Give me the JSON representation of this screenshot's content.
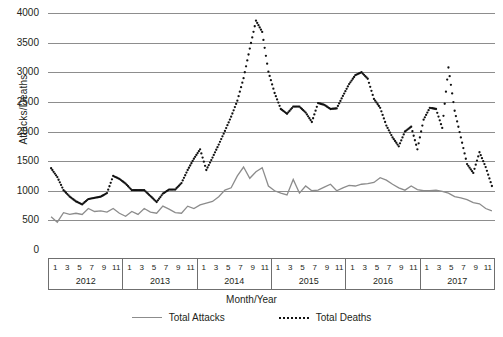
{
  "chart_data": {
    "type": "line",
    "title": "",
    "xlabel": "Month/Year",
    "ylabel": "Attacks/Deaths",
    "ylim": [
      0,
      4000
    ],
    "yticks": [
      0,
      500,
      1000,
      1500,
      2000,
      2500,
      3000,
      3500,
      4000
    ],
    "grid": true,
    "legend_position": "bottom",
    "years": [
      "2012",
      "2013",
      "2014",
      "2015",
      "2016",
      "2017"
    ],
    "month_ticks": [
      "1",
      "3",
      "5",
      "7",
      "9",
      "11"
    ],
    "x": [
      "2012-01",
      "2012-02",
      "2012-03",
      "2012-04",
      "2012-05",
      "2012-06",
      "2012-07",
      "2012-08",
      "2012-09",
      "2012-10",
      "2012-11",
      "2012-12",
      "2013-01",
      "2013-02",
      "2013-03",
      "2013-04",
      "2013-05",
      "2013-06",
      "2013-07",
      "2013-08",
      "2013-09",
      "2013-10",
      "2013-11",
      "2013-12",
      "2014-01",
      "2014-02",
      "2014-03",
      "2014-04",
      "2014-05",
      "2014-06",
      "2014-07",
      "2014-08",
      "2014-09",
      "2014-10",
      "2014-11",
      "2014-12",
      "2015-01",
      "2015-02",
      "2015-03",
      "2015-04",
      "2015-05",
      "2015-06",
      "2015-07",
      "2015-08",
      "2015-09",
      "2015-10",
      "2015-11",
      "2015-12",
      "2016-01",
      "2016-02",
      "2016-03",
      "2016-04",
      "2016-05",
      "2016-06",
      "2016-07",
      "2016-08",
      "2016-09",
      "2016-10",
      "2016-11",
      "2016-12",
      "2017-01",
      "2017-02",
      "2017-03",
      "2017-04",
      "2017-05",
      "2017-06",
      "2017-07",
      "2017-08",
      "2017-09",
      "2017-10",
      "2017-11",
      "2017-12"
    ],
    "series": [
      {
        "name": "Total Attacks",
        "style": "solid",
        "color": "#8c8c8c",
        "values": [
          560,
          470,
          630,
          600,
          620,
          600,
          700,
          650,
          660,
          640,
          700,
          620,
          570,
          650,
          600,
          700,
          640,
          620,
          740,
          690,
          630,
          620,
          740,
          700,
          760,
          790,
          820,
          900,
          1010,
          1050,
          1250,
          1400,
          1210,
          1320,
          1390,
          1080,
          1000,
          960,
          930,
          1190,
          960,
          1080,
          1000,
          1010,
          1060,
          1110,
          1000,
          1050,
          1090,
          1080,
          1110,
          1120,
          1140,
          1220,
          1180,
          1110,
          1050,
          1010,
          1080,
          1020,
          1000,
          1000,
          1010,
          990,
          960,
          900,
          880,
          850,
          800,
          780,
          700,
          660
        ]
      },
      {
        "name": "Total Deaths",
        "style": "dotted",
        "color": "#111111",
        "values": [
          1380,
          1230,
          1010,
          900,
          820,
          770,
          860,
          880,
          900,
          960,
          1250,
          1200,
          1120,
          1010,
          1010,
          1010,
          910,
          810,
          950,
          1020,
          1020,
          1130,
          1350,
          1540,
          1700,
          1350,
          1560,
          1780,
          2010,
          2250,
          2520,
          2900,
          3400,
          3870,
          3680,
          3010,
          2650,
          2380,
          2300,
          2420,
          2420,
          2320,
          2160,
          2480,
          2450,
          2380,
          2390,
          2600,
          2800,
          2950,
          3000,
          2890,
          2550,
          2400,
          2100,
          1900,
          1750,
          2000,
          2080,
          1700,
          2200,
          2400,
          2380,
          2060,
          3080,
          2350,
          1900,
          1450,
          1300,
          1650,
          1400,
          1080
        ]
      }
    ]
  }
}
